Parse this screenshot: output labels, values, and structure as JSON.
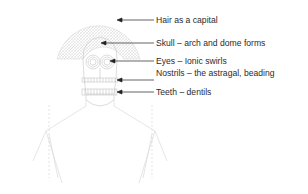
{
  "diagram": {
    "labels": [
      {
        "id": "hair",
        "text": "Hair as a capital",
        "y": 14
      },
      {
        "id": "skull",
        "text": "Skull – arch and dome forms",
        "y": 37
      },
      {
        "id": "eyes",
        "text": "Eyes – Ionic swirls",
        "y": 55
      },
      {
        "id": "nostrils",
        "text": "Nostrils – the astragal, beading",
        "y": 68
      },
      {
        "id": "teeth",
        "text": "Teeth – dentils",
        "y": 86
      }
    ],
    "colors": {
      "text": "#2b2b2b",
      "arrow": "#222222",
      "drawing": "#c8c8c8",
      "hatch": "#d4d4d4"
    }
  }
}
